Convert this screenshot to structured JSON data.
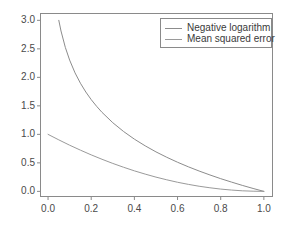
{
  "figure": {
    "background_color": "#ffffff",
    "axis_color": "#8a8a8a",
    "tick_label_color": "#4a4a4a"
  },
  "legend": {
    "position": "upper right",
    "border_color": "#8a8a8a",
    "background_color": "#ffffff",
    "entries": [
      {
        "label": "Negative logarithm",
        "color": "#8c8c8c"
      },
      {
        "label": "Mean squared error",
        "color": "#9a9a9a"
      }
    ]
  },
  "axes": {
    "x_tick_labels": [
      "0.0",
      "0.2",
      "0.4",
      "0.6",
      "0.8",
      "1.0"
    ],
    "y_tick_labels": [
      "0.0",
      "0.5",
      "1.0",
      "1.5",
      "2.0",
      "2.5",
      "3.0"
    ]
  },
  "chart_data": {
    "type": "line",
    "title": "",
    "xlabel": "",
    "ylabel": "",
    "xlim": [
      -0.035,
      1.04
    ],
    "ylim": [
      -0.09,
      3.12
    ],
    "xticks": [
      0.0,
      0.2,
      0.4,
      0.6,
      0.8,
      1.0
    ],
    "yticks": [
      0.0,
      0.5,
      1.0,
      1.5,
      2.0,
      2.5,
      3.0
    ],
    "grid": false,
    "legend_position": "upper right",
    "series": [
      {
        "name": "Negative logarithm",
        "formula": "-ln(x)",
        "color": "#8c8c8c",
        "x": [
          0.0498,
          0.06,
          0.08,
          0.1,
          0.125,
          0.15,
          0.175,
          0.2,
          0.225,
          0.25,
          0.3,
          0.35,
          0.4,
          0.45,
          0.5,
          0.55,
          0.6,
          0.65,
          0.7,
          0.75,
          0.8,
          0.85,
          0.9,
          0.95,
          1.0
        ],
        "values": [
          3.0,
          2.813,
          2.526,
          2.303,
          2.079,
          1.897,
          1.743,
          1.609,
          1.492,
          1.386,
          1.204,
          1.05,
          0.916,
          0.799,
          0.693,
          0.598,
          0.511,
          0.431,
          0.357,
          0.288,
          0.223,
          0.163,
          0.105,
          0.051,
          0.0
        ]
      },
      {
        "name": "Mean squared error",
        "formula": "(1 - x)^2",
        "color": "#9a9a9a",
        "x": [
          0.0,
          0.05,
          0.1,
          0.15,
          0.2,
          0.25,
          0.3,
          0.35,
          0.4,
          0.45,
          0.5,
          0.55,
          0.6,
          0.65,
          0.7,
          0.75,
          0.8,
          0.85,
          0.9,
          0.95,
          1.0
        ],
        "values": [
          1.0,
          0.903,
          0.81,
          0.723,
          0.64,
          0.563,
          0.49,
          0.423,
          0.36,
          0.303,
          0.25,
          0.203,
          0.16,
          0.123,
          0.09,
          0.063,
          0.04,
          0.023,
          0.01,
          0.003,
          0.0
        ]
      }
    ]
  }
}
